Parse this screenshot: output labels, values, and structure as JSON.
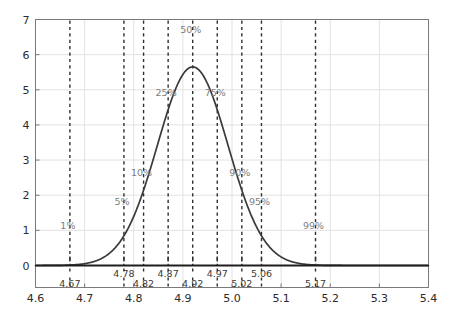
{
  "chart_data": {
    "type": "line",
    "title": "",
    "xlabel": "",
    "ylabel": "",
    "xlim": [
      4.6,
      5.4
    ],
    "ylim": [
      0,
      7
    ],
    "grid": true,
    "legend": null,
    "distribution": {
      "kind": "normal_pdf",
      "mean": 4.92,
      "sigma": 0.0718,
      "peak_x": 4.92,
      "peak_y": 5.65
    },
    "x_ticks": [
      "4.6",
      "4.7",
      "4.8",
      "4.9",
      "5.0",
      "5.1",
      "5.2",
      "5.3",
      "5.4"
    ],
    "x_tick_values": [
      4.6,
      4.7,
      4.8,
      4.9,
      5.0,
      5.1,
      5.2,
      5.3,
      5.4
    ],
    "y_ticks": [
      "0",
      "1",
      "2",
      "3",
      "4",
      "5",
      "6",
      "7"
    ],
    "y_tick_values": [
      0,
      1,
      2,
      3,
      4,
      5,
      6,
      7
    ],
    "percentiles": [
      {
        "label": "1%",
        "value_label": "4.67",
        "x": 4.67,
        "annot_y": 1.05,
        "row": "low"
      },
      {
        "label": "5%",
        "value_label": "4.78",
        "x": 4.78,
        "annot_y": 1.72,
        "row": "high"
      },
      {
        "label": "10%",
        "value_label": "4.82",
        "x": 4.82,
        "annot_y": 2.55,
        "row": "low"
      },
      {
        "label": "25%",
        "value_label": "4.87",
        "x": 4.87,
        "annot_y": 4.82,
        "row": "high"
      },
      {
        "label": "50%",
        "value_label": "4.92",
        "x": 4.92,
        "annot_y": 6.62,
        "row": "low"
      },
      {
        "label": "75%",
        "value_label": "4.97",
        "x": 4.97,
        "annot_y": 4.82,
        "row": "high"
      },
      {
        "label": "90%",
        "value_label": "5.02",
        "x": 5.02,
        "annot_y": 2.55,
        "row": "low"
      },
      {
        "label": "95%",
        "value_label": "5.06",
        "x": 5.06,
        "annot_y": 1.72,
        "row": "high"
      },
      {
        "label": "99%",
        "value_label": "5.17",
        "x": 5.17,
        "annot_y": 1.05,
        "row": "low"
      }
    ],
    "colors": {
      "curve": "#3a3a3a",
      "dashed_marker": "#2f2f2f",
      "grid": "#e2e2e2",
      "axis": "#7a7a7a",
      "baseline": "#1e1e1e",
      "annotation_text": "#7d7d7d",
      "tick_text": "#2b2b2b",
      "background": "#ffffff"
    }
  }
}
